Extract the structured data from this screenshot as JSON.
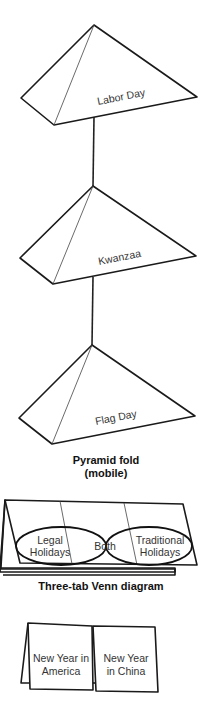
{
  "pyramid_mobile": {
    "caption_line1": "Pyramid fold",
    "caption_line2": "(mobile)",
    "pyramids": [
      {
        "label": "Labor Day"
      },
      {
        "label": "Kwanzaa"
      },
      {
        "label": "Flag Day"
      }
    ]
  },
  "venn_diagram": {
    "caption": "Three-tab Venn diagram",
    "left_label_line1": "Legal",
    "left_label_line2": "Holidays",
    "center_label": "Both",
    "right_label_line1": "Traditional",
    "right_label_line2": "Holidays"
  },
  "two_tab_card": {
    "left_label_line1": "New Year in",
    "left_label_line2": "America",
    "right_label_line1": "New Year",
    "right_label_line2": "in China"
  }
}
